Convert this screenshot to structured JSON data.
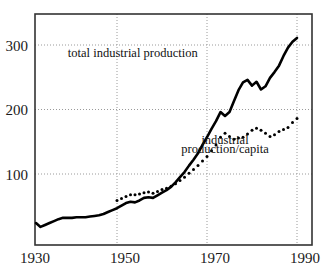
{
  "chart_data": {
    "type": "line",
    "title": "",
    "xlabel": "",
    "ylabel": "",
    "xlim": [
      1930,
      1992
    ],
    "ylim": [
      0,
      330
    ],
    "grid": true,
    "legend_position": "inline-annotations",
    "x_ticks": [
      1930,
      1950,
      1970,
      1990
    ],
    "x_tick_labels": [
      "1930",
      "1950",
      "1970",
      "1990"
    ],
    "y_ticks": [
      100,
      200,
      300
    ],
    "y_tick_labels": [
      "100",
      "200",
      "300"
    ],
    "annotations": [
      {
        "name": "total-industrial-production-label",
        "text": "total industrial production",
        "x": 1953.5,
        "y": 281
      },
      {
        "name": "industrial-production-per-capita-label-line1",
        "text": "industrial",
        "x": 1974.0,
        "y": 147
      },
      {
        "name": "industrial-production-per-capita-label-line2",
        "text": "production/capita",
        "x": 1974.0,
        "y": 133
      }
    ],
    "series": [
      {
        "name": "total industrial production",
        "style": "solid",
        "color": "#000000",
        "width": 2.6,
        "x": [
          1932,
          1933,
          1934,
          1935,
          1936,
          1937,
          1938,
          1939,
          1940,
          1941,
          1942,
          1943,
          1944,
          1945,
          1946,
          1947,
          1948,
          1949,
          1950,
          1951,
          1952,
          1953,
          1954,
          1955,
          1956,
          1957,
          1958,
          1959,
          1960,
          1961,
          1962,
          1963,
          1964,
          1965,
          1966,
          1967,
          1968,
          1969,
          1970,
          1971,
          1972,
          1973,
          1974,
          1975,
          1976,
          1977,
          1978,
          1979,
          1980,
          1981,
          1982,
          1983,
          1984,
          1985,
          1986,
          1987,
          1988,
          1989,
          1990
        ],
        "y": [
          24,
          18,
          21,
          24,
          27,
          30,
          32,
          32,
          32,
          33,
          33,
          33,
          34,
          35,
          36,
          38,
          41,
          44,
          47,
          51,
          55,
          57,
          56,
          59,
          63,
          64,
          63,
          67,
          71,
          75,
          80,
          87,
          95,
          103,
          113,
          122,
          132,
          145,
          157,
          170,
          182,
          196,
          190,
          196,
          213,
          230,
          242,
          246,
          237,
          243,
          231,
          236,
          249,
          258,
          268,
          283,
          296,
          305,
          311
        ]
      },
      {
        "name": "industrial production/capita",
        "style": "dotted",
        "color": "#000000",
        "width": 3.0,
        "x": [
          1950,
          1951,
          1952,
          1953,
          1954,
          1955,
          1956,
          1957,
          1958,
          1959,
          1960,
          1961,
          1962,
          1963,
          1964,
          1965,
          1966,
          1967,
          1968,
          1969,
          1970,
          1971,
          1972,
          1973,
          1974,
          1975,
          1976,
          1977,
          1978,
          1979,
          1980,
          1981,
          1982,
          1983,
          1984,
          1985,
          1986,
          1987,
          1988,
          1989,
          1990
        ],
        "y": [
          59,
          62,
          65,
          68,
          68,
          69,
          71,
          72,
          70,
          73,
          76,
          78,
          81,
          85,
          90,
          95,
          101,
          107,
          113,
          120,
          127,
          136,
          145,
          157,
          163,
          158,
          154,
          156,
          157,
          162,
          168,
          171,
          168,
          163,
          158,
          161,
          166,
          169,
          172,
          180,
          186
        ]
      }
    ]
  }
}
